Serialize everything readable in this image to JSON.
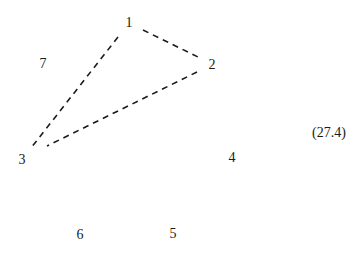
{
  "diagram": {
    "type": "graph",
    "equation_number": "(27.4)",
    "nodes": [
      {
        "id": "1",
        "label": "1",
        "x": 129,
        "y": 23
      },
      {
        "id": "2",
        "label": "2",
        "x": 212,
        "y": 65
      },
      {
        "id": "3",
        "label": "3",
        "x": 22,
        "y": 160
      },
      {
        "id": "4",
        "label": "4",
        "x": 232,
        "y": 158
      },
      {
        "id": "5",
        "label": "5",
        "x": 173,
        "y": 234
      },
      {
        "id": "6",
        "label": "6",
        "x": 80,
        "y": 235
      },
      {
        "id": "7",
        "label": "7",
        "x": 43,
        "y": 64
      }
    ],
    "edges": [
      {
        "from": "1",
        "to": "2",
        "style": "dashed",
        "x1": 143,
        "y1": 30,
        "x2": 198,
        "y2": 57
      },
      {
        "from": "1",
        "to": "3",
        "style": "dashed",
        "x1": 118,
        "y1": 37,
        "x2": 31,
        "y2": 148
      },
      {
        "from": "2",
        "to": "3",
        "style": "dashed",
        "x1": 197,
        "y1": 72,
        "x2": 47,
        "y2": 146
      }
    ],
    "colors": {
      "ink": "#1a1a1a",
      "background": "#ffffff"
    }
  }
}
